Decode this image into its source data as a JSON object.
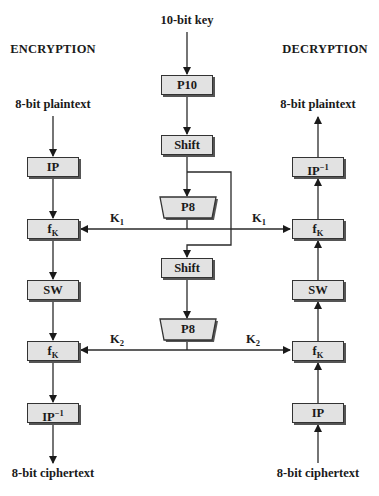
{
  "diagram": {
    "type": "flowchart",
    "title_left": "ENCRYPTION",
    "title_right": "DECRYPTION",
    "key_input": "10-bit key",
    "encryption": {
      "input": "8-bit plaintext",
      "output": "8-bit ciphertext",
      "steps": [
        {
          "label": "IP",
          "sup": ""
        },
        {
          "label": "f",
          "sub": "K"
        },
        {
          "label": "SW"
        },
        {
          "label": "f",
          "sub": "K"
        },
        {
          "label": "IP",
          "sup": "−1"
        }
      ]
    },
    "key_generation": {
      "steps": [
        {
          "label": "P10"
        },
        {
          "label": "Shift"
        },
        {
          "label": "P8"
        },
        {
          "label": "Shift"
        },
        {
          "label": "P8"
        }
      ]
    },
    "decryption": {
      "input": "8-bit ciphertext",
      "output": "8-bit plaintext",
      "steps": [
        {
          "label": "IP",
          "sup": "−1"
        },
        {
          "label": "f",
          "sub": "K"
        },
        {
          "label": "SW"
        },
        {
          "label": "f",
          "sub": "K"
        },
        {
          "label": "IP"
        }
      ]
    },
    "subkeys": {
      "k1": {
        "base": "K",
        "sub": "1"
      },
      "k2": {
        "base": "K",
        "sub": "2"
      }
    },
    "colors": {
      "box_fill": "#e2e2e2",
      "stroke": "#333333",
      "shadow": "#555555",
      "background": "#ffffff"
    }
  }
}
